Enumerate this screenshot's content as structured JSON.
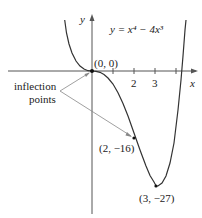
{
  "figure": {
    "equation_label": "y = x⁴ − 4x³",
    "axis_labels": {
      "x": "x",
      "y": "y"
    },
    "x_ticks": [
      {
        "value": 1,
        "label": ""
      },
      {
        "value": 2,
        "label": "2"
      },
      {
        "value": 3,
        "label": "3"
      },
      {
        "value": 4,
        "label": ""
      }
    ],
    "points": [
      {
        "x": 0,
        "y": 0,
        "label": "(0, 0)"
      },
      {
        "x": 2,
        "y": -16,
        "label": "(2, −16)"
      },
      {
        "x": 3,
        "y": -27,
        "label": "(3, −27)"
      }
    ],
    "annotation": {
      "line1": "inflection",
      "line2": "points"
    },
    "colors": {
      "curve": "#333333",
      "axis": "#555555",
      "arrow": "#888888"
    }
  }
}
